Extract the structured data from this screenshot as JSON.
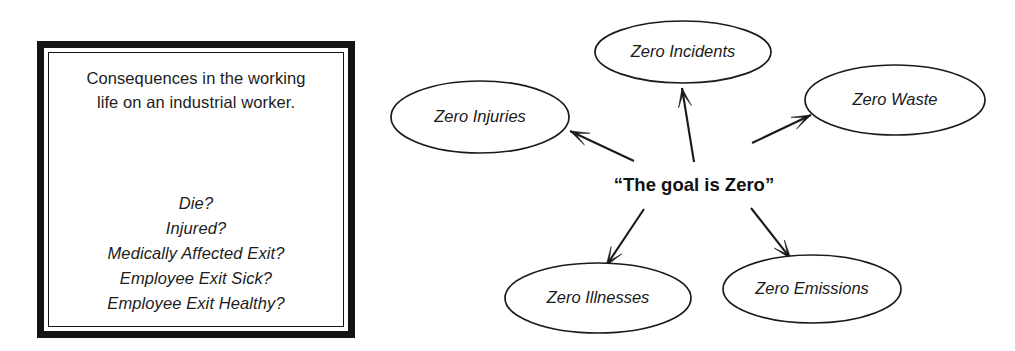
{
  "consequence_box": {
    "heading_line_1": "Consequences in the working",
    "heading_line_2": "life on an industrial worker.",
    "items": [
      "Die?",
      "Injured?",
      "Medically Affected Exit?",
      "Employee Exit Sick?",
      "Employee Exit Healthy?"
    ]
  },
  "diagram": {
    "center_label": "“The goal is Zero”",
    "nodes": [
      {
        "id": "zero-incidents",
        "label": "Zero Incidents",
        "cx": 683,
        "cy": 52,
        "rx": 88,
        "ry": 31
      },
      {
        "id": "zero-injuries",
        "label": "Zero Injuries",
        "cx": 480,
        "cy": 117,
        "rx": 89,
        "ry": 36
      },
      {
        "id": "zero-waste",
        "label": "Zero Waste",
        "cx": 895,
        "cy": 100,
        "rx": 90,
        "ry": 35
      },
      {
        "id": "zero-illnesses",
        "label": "Zero Illnesses",
        "cx": 598,
        "cy": 298,
        "rx": 93,
        "ry": 35
      },
      {
        "id": "zero-emissions",
        "label": "Zero Emissions",
        "cx": 812,
        "cy": 289,
        "rx": 89,
        "ry": 34
      }
    ],
    "edges": [
      {
        "id": "edge-to-incidents",
        "from": "center",
        "to": "zero-incidents",
        "x1": 694,
        "y1": 162,
        "x2": 682,
        "y2": 88
      },
      {
        "id": "edge-to-injuries",
        "from": "center",
        "to": "zero-injuries",
        "x1": 634,
        "y1": 161,
        "x2": 570,
        "y2": 131
      },
      {
        "id": "edge-to-waste",
        "from": "center",
        "to": "zero-waste",
        "x1": 752,
        "y1": 143,
        "x2": 811,
        "y2": 115
      },
      {
        "id": "edge-to-illnesses",
        "from": "center",
        "to": "zero-illnesses",
        "x1": 644,
        "y1": 209,
        "x2": 606,
        "y2": 266
      },
      {
        "id": "edge-to-emissions",
        "from": "center",
        "to": "zero-emissions",
        "x1": 751,
        "y1": 208,
        "x2": 791,
        "y2": 259
      }
    ],
    "center": {
      "x": 694,
      "y": 186
    }
  },
  "colors": {
    "ink": "#1a1a1a",
    "paper": "#ffffff",
    "box_border": "#141414"
  }
}
